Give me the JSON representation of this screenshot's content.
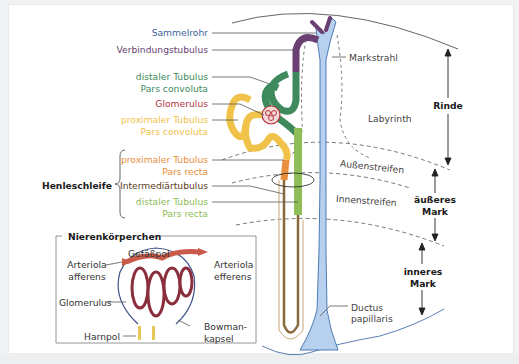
{
  "diagram": {
    "colors": {
      "sammelrohr": "#3e5e9c",
      "verbindungstubulus": "#6a3f72",
      "distal_convoluta": "#3f8a5c",
      "glomerulus": "#b5333d",
      "proximal_convoluta": "#f0c24a",
      "proximal_recta": "#e88e3c",
      "intermediar": "#7a5a2c",
      "distal_recta": "#8fbd58",
      "collecting_duct_fill": "#b6d0ee",
      "line": "#555555"
    },
    "left_labels": {
      "sammelrohr": "Sammelrohr",
      "verbindungstubulus": "Verbindungstubulus",
      "distal_convoluta_1": "distaler Tubulus",
      "distal_convoluta_2": "Pars convoluta",
      "glomerulus": "Glomerulus",
      "proximal_convoluta_1": "proximaler Tubulus",
      "proximal_convoluta_2": "Pars convoluta",
      "proximal_recta_1": "proximaler Tubulus",
      "proximal_recta_2": "Pars recta",
      "intermediar": "Intermediärtubulus",
      "distal_recta_1": "distaler Tubulus",
      "distal_recta_2": "Pars recta",
      "henleschleife": "Henleschleife"
    },
    "zone_labels": {
      "markstrahl": "Markstrahl",
      "labyrinth": "Labyrinth",
      "aussenstreifen": "Außenstreifen",
      "innenstreifen": "Innenstreifen",
      "ductus_1": "Ductus",
      "ductus_2": "papillaris"
    },
    "region_labels": {
      "rinde": "Rinde",
      "aeusseres_1": "äußeres",
      "aeusseres_2": "Mark",
      "inneres_1": "inneres",
      "inneres_2": "Mark"
    },
    "inset": {
      "title": "Nierenkörperchen",
      "gefaesspol": "Gefäßpol",
      "afferens_1": "Arteriola",
      "afferens_2": "afferens",
      "efferens_1": "Arteriola",
      "efferens_2": "efferens",
      "glomerulus": "Glomerulus",
      "bowman_1": "Bowman-",
      "bowman_2": "kapsel",
      "harnpol": "Harnpol"
    }
  }
}
